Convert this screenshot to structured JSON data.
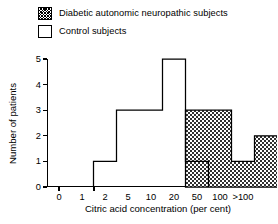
{
  "legend": {
    "items": [
      {
        "label": "Diabetic autonomic neuropathic subjects",
        "swatch": "hatched-swatch-icon",
        "fill": "hatched"
      },
      {
        "label": "Control subjects",
        "swatch": "open-swatch-icon",
        "fill": "open"
      }
    ]
  },
  "chart_data": {
    "type": "bar",
    "title": "",
    "xlabel": "Citric acid concentration (per cent)",
    "ylabel": "Number of patients",
    "xticklabels": [
      "0",
      "1",
      "2",
      "5",
      "10",
      "20",
      "50",
      "100",
      ">100"
    ],
    "yticklabels": [
      "0",
      "1",
      "2",
      "3",
      "4",
      "5"
    ],
    "ylim": [
      0,
      5
    ],
    "ytick_values": [
      0,
      1,
      2,
      3,
      4,
      5
    ],
    "xscale": "log-categorical",
    "grid": false,
    "legend_position": "above-plot",
    "bins": [
      "0-1",
      "1-2",
      "2-5",
      "5-10",
      "10-20",
      "20-50",
      "50-100",
      "100->100",
      ">100"
    ],
    "series": [
      {
        "name": "Control subjects",
        "fill": "open",
        "values": [
          0,
          1,
          3,
          3,
          5,
          1,
          0,
          0,
          0
        ]
      },
      {
        "name": "Diabetic autonomic neuropathic subjects",
        "fill": "hatched",
        "values": [
          0,
          0,
          0,
          0,
          0,
          3,
          3,
          1,
          2
        ]
      }
    ]
  }
}
